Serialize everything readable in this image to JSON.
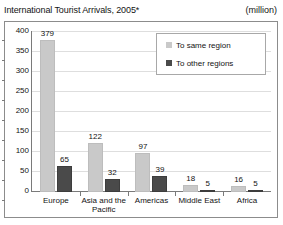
{
  "header": {
    "title": "International Tourist Arrivals, 2005*",
    "unit": "(million)"
  },
  "legend": {
    "items": [
      {
        "label": "To same region",
        "color": "#c9c9c9",
        "key": "same"
      },
      {
        "label": "To other regions",
        "color": "#4a4a4a",
        "key": "other"
      }
    ]
  },
  "axis": {
    "yticks": [
      "400",
      "350",
      "300",
      "250",
      "200",
      "150",
      "100",
      "50",
      "0"
    ]
  },
  "chart_data": {
    "type": "bar",
    "title": "International Tourist Arrivals, 2005*",
    "xlabel": "",
    "ylabel": "",
    "unit": "million",
    "ylim": [
      0,
      400
    ],
    "ytick_step": 50,
    "grid": true,
    "legend_position": "top-right-inside",
    "categories": [
      "Europe",
      "Asia and the\nPacific",
      "Americas",
      "Middle East",
      "Africa"
    ],
    "series": [
      {
        "name": "To same region",
        "color": "#c9c9c9",
        "values": [
          379,
          122,
          97,
          18,
          16
        ]
      },
      {
        "name": "To other regions",
        "color": "#4a4a4a",
        "values": [
          65,
          32,
          39,
          5,
          5
        ]
      }
    ]
  }
}
